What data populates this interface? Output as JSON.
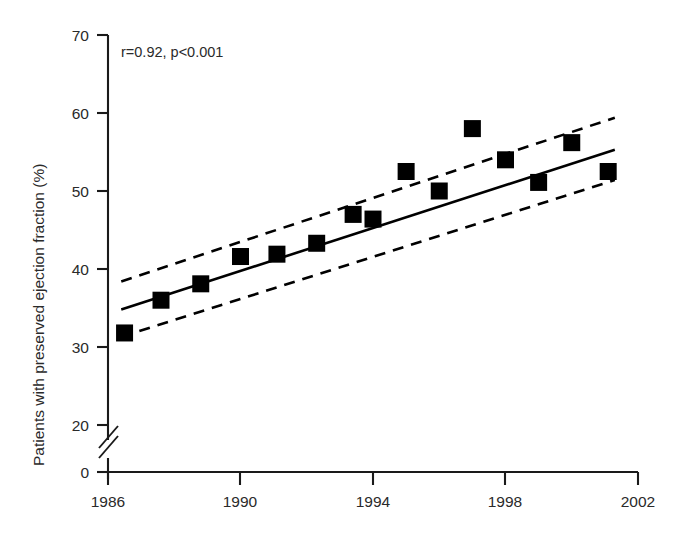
{
  "chart_data": {
    "type": "scatter",
    "title": "",
    "xlabel": "",
    "ylabel": "Patients with preserved ejection fraction (%)",
    "annotation": "r=0.92, p<0.001",
    "xlim": [
      1986,
      2002
    ],
    "ylim": [
      20,
      70
    ],
    "y_axis_break": true,
    "y_break_between": [
      0,
      20
    ],
    "grid": false,
    "legend": "none",
    "xticks": [
      1986,
      1990,
      1994,
      1998,
      2002
    ],
    "xtick_labels": [
      "1986",
      "1990",
      "1994",
      "1998",
      "2002"
    ],
    "yticks": [
      0,
      20,
      30,
      40,
      50,
      60,
      70
    ],
    "ytick_labels": [
      "0",
      "20",
      "30",
      "40",
      "50",
      "60",
      "70"
    ],
    "x": [
      1986.5,
      1987.6,
      1988.8,
      1990.0,
      1991.1,
      1992.3,
      1993.4,
      1994.0,
      1995.0,
      1996.0,
      1997.0,
      1998.0,
      1999.0,
      2000.0,
      2001.1
    ],
    "values": [
      31.8,
      36.0,
      38.1,
      41.6,
      41.9,
      43.3,
      47.0,
      46.4,
      52.5,
      50.0,
      58.0,
      54.0,
      51.1,
      56.2,
      52.5
    ],
    "marker": "square",
    "series": [
      {
        "name": "Observed proportion",
        "x": [
          1986.5,
          1987.6,
          1988.8,
          1990.0,
          1991.1,
          1992.3,
          1993.4,
          1994.0,
          1995.0,
          1996.0,
          1997.0,
          1998.0,
          1999.0,
          2000.0,
          2001.1
        ],
        "values": [
          31.8,
          36.0,
          38.1,
          41.6,
          41.9,
          43.3,
          47.0,
          46.4,
          52.5,
          50.0,
          58.0,
          54.0,
          51.1,
          56.2,
          52.5
        ]
      },
      {
        "name": "Linear regression fit",
        "type": "line",
        "x": [
          1986.4,
          2001.3
        ],
        "values": [
          34.8,
          55.3
        ]
      },
      {
        "name": "Upper 95% confidence limit",
        "type": "dashed-line",
        "x": [
          1986.4,
          2001.3
        ],
        "values": [
          38.4,
          59.4
        ]
      },
      {
        "name": "Lower 95% confidence limit",
        "type": "dashed-line",
        "x": [
          1986.4,
          2001.3
        ],
        "values": [
          31.3,
          51.4
        ]
      }
    ]
  }
}
